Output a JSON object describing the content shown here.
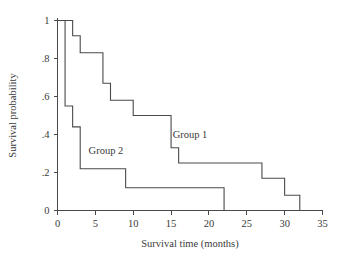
{
  "chart_data": {
    "type": "line",
    "title": "",
    "subtitle": "",
    "xlabel": "Survival time (months)",
    "ylabel": "Survival probability",
    "xlim": [
      0,
      35
    ],
    "ylim": [
      0,
      1
    ],
    "xticks": [
      0,
      5,
      10,
      15,
      20,
      25,
      30,
      35
    ],
    "xtick_labels": [
      "0",
      "5",
      "10",
      "15",
      "20",
      "25",
      "30",
      "35"
    ],
    "yticks": [
      0,
      0.2,
      0.4,
      0.6,
      0.8,
      1
    ],
    "ytick_labels": [
      "0",
      ".2",
      ".4",
      ".6",
      ".8",
      "1"
    ],
    "grid": false,
    "legend_position": "inline-annotation",
    "step_style": "post",
    "series": [
      {
        "name": "Group 1",
        "label_x": 17.5,
        "label_y": 0.38,
        "color": "#4a4a4a",
        "x": [
          0,
          2,
          2,
          3,
          3,
          6,
          6,
          7,
          7,
          10,
          10,
          15,
          15,
          16,
          16,
          27,
          27,
          30,
          30,
          32,
          32
        ],
        "y": [
          1.0,
          1.0,
          0.92,
          0.92,
          0.83,
          0.83,
          0.67,
          0.67,
          0.58,
          0.58,
          0.5,
          0.5,
          0.33,
          0.33,
          0.25,
          0.25,
          0.17,
          0.17,
          0.08,
          0.08,
          0.0
        ],
        "drop_times": [
          2,
          3,
          6,
          7,
          10,
          15,
          16,
          27,
          30,
          32
        ],
        "plateau_values": [
          1.0,
          0.92,
          0.83,
          0.67,
          0.58,
          0.5,
          0.33,
          0.25,
          0.17,
          0.08,
          0.0
        ]
      },
      {
        "name": "Group 2",
        "label_x": 6.4,
        "label_y": 0.3,
        "color": "#4a4a4a",
        "x": [
          0,
          1,
          1,
          2,
          2,
          3,
          3,
          9,
          9,
          22,
          22
        ],
        "y": [
          1.0,
          1.0,
          0.55,
          0.55,
          0.44,
          0.44,
          0.22,
          0.22,
          0.12,
          0.12,
          0.0
        ],
        "drop_times": [
          1,
          2,
          3,
          9,
          22
        ],
        "plateau_values": [
          1.0,
          0.55,
          0.44,
          0.22,
          0.12,
          0.0
        ]
      }
    ]
  },
  "figure": {
    "partial_caption": ""
  }
}
